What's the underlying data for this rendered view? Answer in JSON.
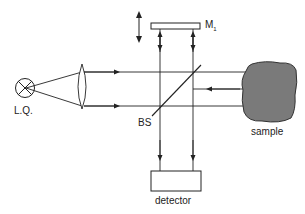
{
  "diagram": {
    "type": "optical-setup",
    "labels": {
      "lamp": "L.Q.",
      "beamsplitter": "BS",
      "mirror": "M",
      "mirror_subscript": "1",
      "sample": "sample",
      "detector": "detector"
    },
    "colors": {
      "line": "#222222",
      "sample_fill": "#7a7a7a",
      "sample_stroke": "#333333",
      "mirror_fill": "#ffffff"
    },
    "components": [
      {
        "id": "lamp",
        "label": "L.Q."
      },
      {
        "id": "lens"
      },
      {
        "id": "beamsplitter",
        "label": "BS"
      },
      {
        "id": "mirror",
        "label": "M1",
        "movable": true
      },
      {
        "id": "sample",
        "label": "sample"
      },
      {
        "id": "detector",
        "label": "detector"
      }
    ]
  }
}
